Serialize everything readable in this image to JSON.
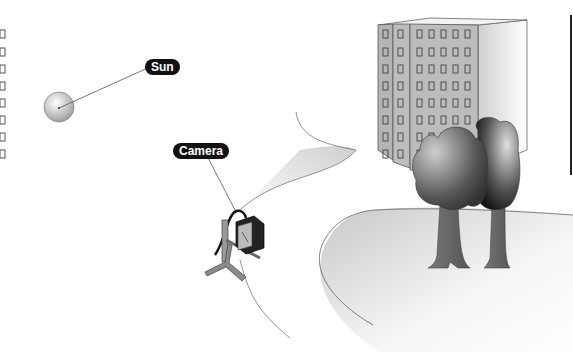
{
  "labels": {
    "sun": "Sun",
    "camera": "Camera"
  },
  "scene": {
    "elements": [
      "sun",
      "camera-on-tripod",
      "apartment-building",
      "two-trees",
      "path",
      "lawn"
    ]
  },
  "colors": {
    "label_bg": "#111111",
    "label_text": "#ffffff",
    "line": "#555555",
    "building_face": "#b8b8b8",
    "building_side": "#e8e8e8",
    "tree_dark": "#222222"
  }
}
